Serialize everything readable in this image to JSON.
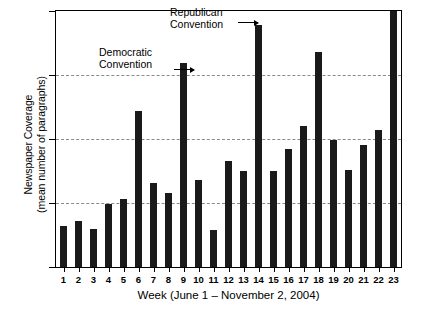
{
  "chart_data": {
    "type": "bar",
    "title": "",
    "xlabel": "Week (June 1 – November 2, 2004)",
    "ylabel_line1": "Newspaper Coverage",
    "ylabel_line2": "(mean number of paragraphs)",
    "categories": [
      "1",
      "2",
      "3",
      "4",
      "5",
      "6",
      "7",
      "8",
      "9",
      "10",
      "11",
      "12",
      "13",
      "14",
      "15",
      "16",
      "17",
      "18",
      "19",
      "20",
      "21",
      "22",
      "23"
    ],
    "values": [
      3.2,
      3.6,
      3.0,
      4.9,
      5.3,
      12.2,
      6.6,
      5.8,
      15.9,
      6.8,
      2.9,
      8.3,
      7.5,
      18.9,
      7.5,
      9.2,
      11.0,
      16.8,
      9.9,
      7.6,
      9.5,
      10.7,
      20.0
    ],
    "ylim": [
      0,
      20
    ],
    "yticks": [
      "0",
      "5",
      "10",
      "15",
      "20"
    ],
    "ytick_values": [
      0,
      5,
      10,
      15,
      20
    ],
    "grid": "horizontal-dashed",
    "legend": "none",
    "bar_color": "#1a1a1a",
    "annotations": [
      {
        "id": "democratic",
        "line1": "Democratic",
        "line2": "Convention",
        "points_to_category": "9"
      },
      {
        "id": "republican",
        "line1": "Republican",
        "line2": "Convention",
        "points_to_category": "14"
      }
    ]
  }
}
